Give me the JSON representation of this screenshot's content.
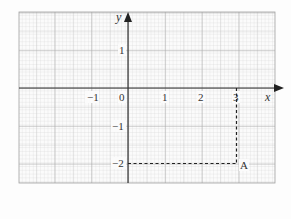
{
  "diagram": {
    "type": "coordinate-grid",
    "axes": {
      "x_label": "x",
      "y_label": "y"
    },
    "x_ticks": [
      {
        "value": -1,
        "label": "−1"
      },
      {
        "value": 0,
        "label": "0"
      },
      {
        "value": 1,
        "label": "1"
      },
      {
        "value": 2,
        "label": "2"
      },
      {
        "value": 3,
        "label": "3"
      }
    ],
    "y_ticks": [
      {
        "value": 1,
        "label": "1"
      },
      {
        "value": -1,
        "label": "−1"
      },
      {
        "value": -2,
        "label": "−2"
      }
    ],
    "point": {
      "label": "A",
      "x": 3,
      "y": -2
    },
    "colors": {
      "grid_minor": "#d0d0d0",
      "grid_major": "#a8a8a8",
      "axis": "#333333",
      "dashed": "#222222"
    }
  }
}
